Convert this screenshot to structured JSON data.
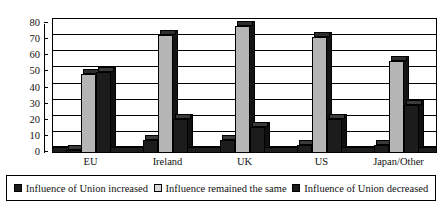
{
  "chart_data": {
    "type": "bar",
    "title": "",
    "xlabel": "",
    "ylabel": "",
    "ylim": [
      0,
      80
    ],
    "yticks": [
      0,
      10,
      20,
      30,
      40,
      50,
      60,
      70,
      80
    ],
    "grid": true,
    "legend_position": "bottom",
    "style": "3d-clustered-column",
    "categories": [
      "EU",
      "Ireland",
      "UK",
      "US",
      "Japan/Other"
    ],
    "series": [
      {
        "name": "Influence of Union increased",
        "color": "#1c1c1c",
        "values": [
          2,
          8,
          8,
          5,
          5
        ]
      },
      {
        "name": "Influence remained the same",
        "color": "#b5b5b5",
        "values": [
          49,
          73,
          79,
          72,
          57
        ]
      },
      {
        "name": "Influence of Union decreased",
        "color": "#1c1c1c",
        "values": [
          50,
          21,
          16,
          21,
          30
        ]
      }
    ]
  },
  "legend": {
    "items": [
      {
        "label": "Influence of Union increased",
        "swatch": "dark"
      },
      {
        "label": "Influence remained the same",
        "swatch": "light"
      },
      {
        "label": "Influence of Union decreased",
        "swatch": "dark"
      }
    ]
  }
}
